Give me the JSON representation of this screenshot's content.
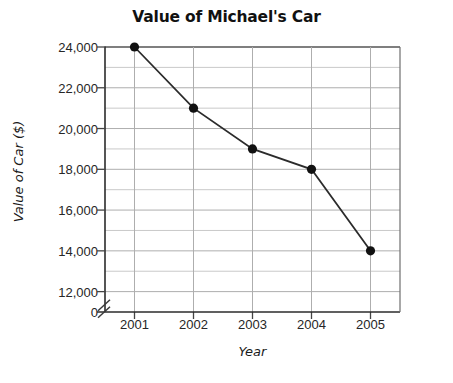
{
  "chart_data": {
    "type": "line",
    "title": "Value of Michael's Car",
    "xlabel": "Year",
    "ylabel": "Value of Car ($)",
    "categories": [
      "2001",
      "2002",
      "2003",
      "2004",
      "2005"
    ],
    "x": [
      2001,
      2002,
      2003,
      2004,
      2005
    ],
    "values": [
      24000,
      21000,
      19000,
      18000,
      14000
    ],
    "series": [
      {
        "name": "Value of Car",
        "values": [
          24000,
          21000,
          19000,
          18000,
          14000
        ]
      }
    ],
    "xlim": [
      2000.5,
      2005.5
    ],
    "ylim": [
      11000,
      24000
    ],
    "y_major_ticks": [
      24000,
      22000,
      20000,
      18000,
      16000,
      14000,
      12000
    ],
    "y_major_tick_labels": [
      "24,000",
      "22,000",
      "20,000",
      "18,000",
      "16,000",
      "14,000",
      "12,000"
    ],
    "y_minor_ticks": [
      23000,
      21000,
      19000,
      17000,
      15000,
      13000
    ],
    "y_origin_label": "0",
    "y_axis_break": true,
    "y_axis_break_symbol": "double-slash",
    "grid": true,
    "grid_color": "#b4b4b4",
    "axis_color": "#333333",
    "line_color": "#2b2b2b",
    "marker_color": "#111111",
    "marker_shape": "circle",
    "background": "#ffffff",
    "legend": false,
    "legend_position": "none"
  }
}
